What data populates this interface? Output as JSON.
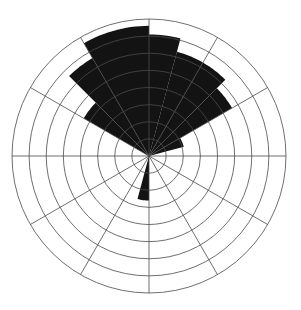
{
  "chart_data": {
    "type": "bar",
    "subtype": "polar-rose",
    "title": "",
    "subtitle": "",
    "xlabel": "",
    "ylabel": "",
    "legend": [],
    "annotations": [],
    "grid": true,
    "legend_position": "none",
    "angular_axis": {
      "label": "",
      "units": "degrees",
      "zero_at": "north",
      "direction": "clockwise",
      "sector_count": 12,
      "sector_width_deg": 30,
      "tick_labels": []
    },
    "radial_axis": {
      "label": "",
      "rlim": [
        0,
        8
      ],
      "ring_count": 8,
      "ring_values": [
        1,
        2,
        3,
        4,
        5,
        6,
        7,
        8
      ],
      "tick_labels": []
    },
    "categories": [
      "0-30",
      "30-60",
      "60-90",
      "90-120",
      "120-150",
      "150-180",
      "180-210",
      "210-240",
      "240-270",
      "270-300",
      "300-330",
      "330-360"
    ],
    "sectors": [
      {
        "start_deg": 330,
        "end_deg": 360,
        "value": 7.6
      },
      {
        "start_deg": 0,
        "end_deg": 15,
        "value": 7.1
      },
      {
        "start_deg": 15,
        "end_deg": 30,
        "value": 6.3
      },
      {
        "start_deg": 30,
        "end_deg": 45,
        "value": 6.3
      },
      {
        "start_deg": 45,
        "end_deg": 60,
        "value": 5.6
      },
      {
        "start_deg": 60,
        "end_deg": 75,
        "value": 2.1
      },
      {
        "start_deg": 75,
        "end_deg": 90,
        "value": 0.0
      },
      {
        "start_deg": 90,
        "end_deg": 120,
        "value": 0.0
      },
      {
        "start_deg": 120,
        "end_deg": 150,
        "value": 0.0
      },
      {
        "start_deg": 150,
        "end_deg": 180,
        "value": 0.0
      },
      {
        "start_deg": 180,
        "end_deg": 195,
        "value": 2.6
      },
      {
        "start_deg": 195,
        "end_deg": 210,
        "value": 0.0
      },
      {
        "start_deg": 210,
        "end_deg": 240,
        "value": 0.0
      },
      {
        "start_deg": 240,
        "end_deg": 270,
        "value": 0.0
      },
      {
        "start_deg": 270,
        "end_deg": 300,
        "value": 0.0
      },
      {
        "start_deg": 300,
        "end_deg": 315,
        "value": 4.4
      },
      {
        "start_deg": 315,
        "end_deg": 330,
        "value": 6.6
      }
    ],
    "values": [
      7.1,
      6.3,
      1.1,
      0.0,
      0.0,
      0.0,
      1.3,
      0.0,
      0.0,
      0.0,
      5.5,
      7.6
    ],
    "series": [
      {
        "name": "",
        "values": [
          7.1,
          6.3,
          1.1,
          0.0,
          0.0,
          0.0,
          1.3,
          0.0,
          0.0,
          0.0,
          5.5,
          7.6
        ]
      }
    ],
    "colors": {
      "fill": "#131313",
      "grid": "#4a4a4a",
      "background": "#ffffff"
    },
    "geometry": {
      "center_x": 149,
      "center_y": 156,
      "max_radius": 137
    }
  }
}
